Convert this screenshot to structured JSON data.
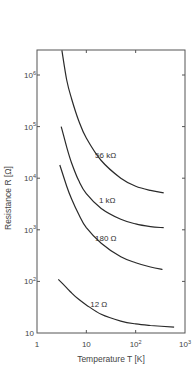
{
  "chart_data": {
    "type": "line",
    "title": "",
    "xlabel": "Temperature T [K]",
    "ylabel": "Resistance R [Ω]",
    "xscale": "log",
    "yscale": "log",
    "xlim": [
      1,
      1000
    ],
    "ylim": [
      10,
      3000000
    ],
    "grid": false,
    "legend": "inline curve labels",
    "x_ticks": [
      {
        "value": 1,
        "base": "1",
        "exp": ""
      },
      {
        "value": 10,
        "base": "10",
        "exp": ""
      },
      {
        "value": 100,
        "base": "10",
        "exp": "2"
      },
      {
        "value": 1000,
        "base": "10",
        "exp": "3"
      }
    ],
    "y_ticks": [
      {
        "value": 10,
        "base": "10",
        "exp": ""
      },
      {
        "value": 100,
        "base": "10",
        "exp": "2"
      },
      {
        "value": 1000,
        "base": "10",
        "exp": "3"
      },
      {
        "value": 10000,
        "base": "10",
        "exp": "4"
      },
      {
        "value": 100000,
        "base": "10",
        "exp": "5"
      },
      {
        "value": 1000000,
        "base": "10",
        "exp": "6"
      }
    ],
    "series": [
      {
        "name": "56 kΩ",
        "label_pos": {
          "T": 15,
          "R": 25000
        },
        "points": [
          [
            3.2,
            3000000
          ],
          [
            4,
            800000
          ],
          [
            5,
            350000
          ],
          [
            7,
            130000
          ],
          [
            10,
            60000
          ],
          [
            20,
            22000
          ],
          [
            50,
            10000
          ],
          [
            100,
            7000
          ],
          [
            200,
            5800
          ],
          [
            370,
            5200
          ]
        ]
      },
      {
        "name": "1 kΩ",
        "label_pos": {
          "T": 18,
          "R": 3300
        },
        "points": [
          [
            3.1,
            100000
          ],
          [
            4,
            40000
          ],
          [
            5,
            20000
          ],
          [
            7,
            9000
          ],
          [
            10,
            5000
          ],
          [
            20,
            2600
          ],
          [
            50,
            1600
          ],
          [
            100,
            1300
          ],
          [
            200,
            1150
          ],
          [
            370,
            1100
          ]
        ]
      },
      {
        "name": "180 Ω",
        "label_pos": {
          "T": 15,
          "R": 600
        },
        "points": [
          [
            2.9,
            18000
          ],
          [
            4,
            7000
          ],
          [
            5,
            4000
          ],
          [
            7,
            2000
          ],
          [
            10,
            1100
          ],
          [
            20,
            550
          ],
          [
            50,
            300
          ],
          [
            100,
            230
          ],
          [
            200,
            190
          ],
          [
            350,
            170
          ]
        ]
      },
      {
        "name": "12 Ω",
        "label_pos": {
          "T": 12,
          "R": 32
        },
        "points": [
          [
            2.7,
            110
          ],
          [
            4,
            75
          ],
          [
            5,
            60
          ],
          [
            7,
            45
          ],
          [
            10,
            35
          ],
          [
            20,
            23
          ],
          [
            50,
            17
          ],
          [
            100,
            15
          ],
          [
            200,
            14
          ],
          [
            600,
            13
          ]
        ]
      }
    ]
  }
}
